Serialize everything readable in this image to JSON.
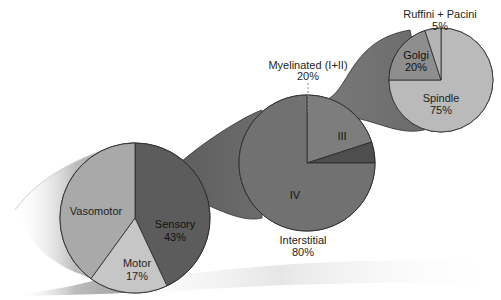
{
  "chart_data": [
    {
      "type": "pie",
      "title": "",
      "slices": [
        {
          "label": "Vasomotor",
          "value": 40,
          "display_value": "",
          "color": "#a9a9a9"
        },
        {
          "label": "Sensory",
          "value": 43,
          "display_value": "43%",
          "color": "#5c5c5c"
        },
        {
          "label": "Motor",
          "value": 17,
          "display_value": "17%",
          "color": "#c6c6c6"
        }
      ],
      "expanded_slice": "Sensory"
    },
    {
      "type": "pie",
      "title": "",
      "slices": [
        {
          "label": "Myelinated (I+II)",
          "value": 20,
          "display_value": "20%",
          "color": "#7d7d7d"
        },
        {
          "label": "III",
          "value": 5,
          "display_value": "",
          "color": "#4e4e4e"
        },
        {
          "label": "IV",
          "value": 75,
          "display_value": "",
          "color": "#717171"
        }
      ],
      "group_label": {
        "text": "Interstitial",
        "value": "80%"
      },
      "expanded_slice": "Myelinated (I+II)"
    },
    {
      "type": "pie",
      "title": "",
      "slices": [
        {
          "label": "Ruffini + Pacini",
          "value": 5,
          "display_value": "5%",
          "color": "#b4b4b4"
        },
        {
          "label": "Golgi",
          "value": 20,
          "display_value": "20%",
          "color": "#8e8e8e"
        },
        {
          "label": "Spindle",
          "value": 75,
          "display_value": "75%",
          "color": "#bababa"
        }
      ]
    }
  ],
  "labels": {
    "vasomotor": "Vasomotor",
    "sensory": "Sensory",
    "sensory_pct": "43%",
    "motor": "Motor",
    "motor_pct": "17%",
    "myelinated": "Myelinated (I+II)",
    "myelinated_pct": "20%",
    "iii": "III",
    "iv": "IV",
    "interstitial": "Interstitial",
    "interstitial_pct": "80%",
    "ruffini": "Ruffini + Pacini",
    "ruffini_pct": "5%",
    "golgi": "Golgi",
    "golgi_pct": "20%",
    "spindle": "Spindle",
    "spindle_pct": "75%"
  }
}
